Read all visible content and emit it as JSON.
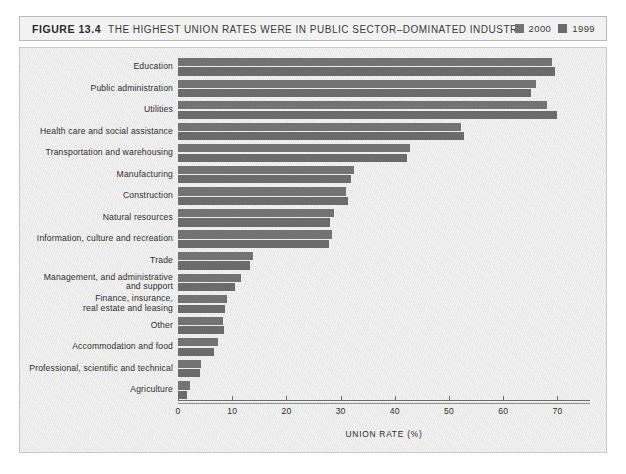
{
  "figure": {
    "number": "FIGURE 13.4",
    "title": "THE HIGHEST UNION RATES WERE IN PUBLIC SECTOR–DOMINATED INDUSTRIES"
  },
  "legend": {
    "position": "top-right",
    "entries": [
      {
        "label": "2000",
        "color": "#737373",
        "swatch_name": "legend-swatch-2000"
      },
      {
        "label": "1999",
        "color": "#6b6b6b",
        "swatch_name": "legend-swatch-1999"
      }
    ]
  },
  "chart_data": {
    "type": "bar",
    "orientation": "horizontal",
    "title": "THE HIGHEST UNION RATES WERE IN PUBLIC SECTOR–DOMINATED INDUSTRIES",
    "xlabel": "UNION RATE (%)",
    "ylabel": "",
    "xlim": [
      0,
      76
    ],
    "xticks": [
      0,
      10,
      20,
      30,
      40,
      50,
      60,
      70
    ],
    "xticklabels": [
      "0",
      "10",
      "20",
      "30",
      "40",
      "50",
      "60",
      "70"
    ],
    "grid": false,
    "legend_position": "top-right",
    "categories": [
      "Education",
      "Public administration",
      "Utilities",
      "Health care and social assistance",
      "Transportation and warehousing",
      "Manufacturing",
      "Construction",
      "Natural resources",
      "Information, culture and recreation",
      "Trade",
      "Management, and administrative\nand support",
      "Finance, insurance,\nreal estate and leasing",
      "Other",
      "Accommodation and food",
      "Professional, scientific and technical",
      "Agriculture"
    ],
    "series": [
      {
        "name": "2000",
        "color": "#737373",
        "values": [
          68.9,
          66.0,
          68.0,
          52.2,
          42.8,
          32.4,
          31.0,
          28.8,
          28.4,
          13.8,
          11.7,
          9.0,
          8.3,
          7.3,
          4.3,
          2.3
        ]
      },
      {
        "name": "1999",
        "color": "#6b6b6b",
        "values": [
          69.6,
          65.2,
          70.0,
          52.8,
          42.2,
          32.0,
          31.4,
          28.0,
          27.8,
          13.3,
          10.5,
          8.6,
          8.4,
          6.7,
          4.0,
          1.7
        ]
      }
    ]
  }
}
